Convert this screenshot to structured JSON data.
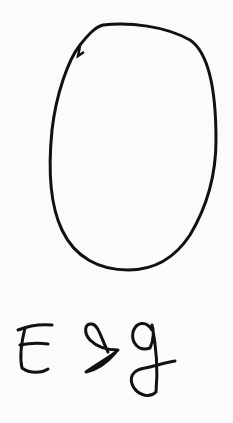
{
  "drawing": {
    "shape": "egg-outline",
    "label": "Egg",
    "stroke_color": "#111111",
    "background_color": "#fbfbfb"
  }
}
